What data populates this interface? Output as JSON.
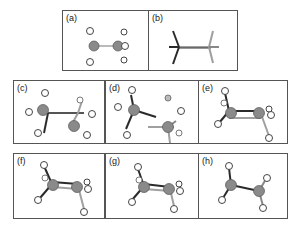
{
  "figure": {
    "panels": [
      {
        "id": "a",
        "label": "(a)"
      },
      {
        "id": "b",
        "label": "(b)"
      },
      {
        "id": "c",
        "label": "(c)"
      },
      {
        "id": "d",
        "label": "(d)"
      },
      {
        "id": "e",
        "label": "(e)"
      },
      {
        "id": "f",
        "label": "(f)"
      },
      {
        "id": "g",
        "label": "(g)"
      },
      {
        "id": "h",
        "label": "(h)"
      }
    ],
    "colors": {
      "carbon": "#8a8a8a",
      "hydrogen": "#ffffff",
      "bond_dark": "#2a2a2a",
      "bond_light": "#a0a0a0",
      "border": "#555555"
    }
  }
}
